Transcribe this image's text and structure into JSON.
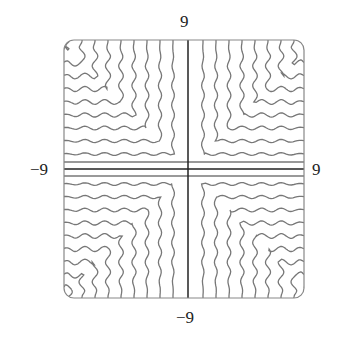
{
  "figure": {
    "type": "contour/level-curve plot",
    "window": {
      "xmin": -9,
      "xmax": 9,
      "ymin": -9,
      "ymax": 9
    },
    "labels": {
      "top": "9",
      "bottom": "−9",
      "left": "−9",
      "right": "9"
    },
    "colors": {
      "curve": "#777777",
      "axis": "#222222",
      "frame": "#888888"
    }
  }
}
